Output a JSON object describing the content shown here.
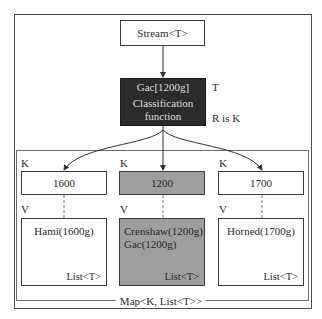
{
  "diagram": {
    "source": {
      "label": "Stream<T>"
    },
    "classifier": {
      "line1": "Gac[1200g]",
      "line2": "Classification",
      "line3": "function",
      "input_label": "T",
      "result_label": "R is K",
      "fill_color": "#2b2b2b"
    },
    "map": {
      "label": "Map<K, List<T>>",
      "entries": [
        {
          "key_label": "K",
          "key": "1600",
          "value_label": "V",
          "items": [
            "Hami(1600g)"
          ],
          "list_label": "List<T>",
          "highlighted": false
        },
        {
          "key_label": "K",
          "key": "1200",
          "value_label": "V",
          "items": [
            "Crenshaw(1200g)",
            "Gac(1200g)"
          ],
          "list_label": "List<T>",
          "highlighted": true
        },
        {
          "key_label": "K",
          "key": "1700",
          "value_label": "V",
          "items": [
            "Horned(1700g)"
          ],
          "list_label": "List<T>",
          "highlighted": false
        }
      ],
      "highlight_color": "#9e9e9e"
    }
  }
}
